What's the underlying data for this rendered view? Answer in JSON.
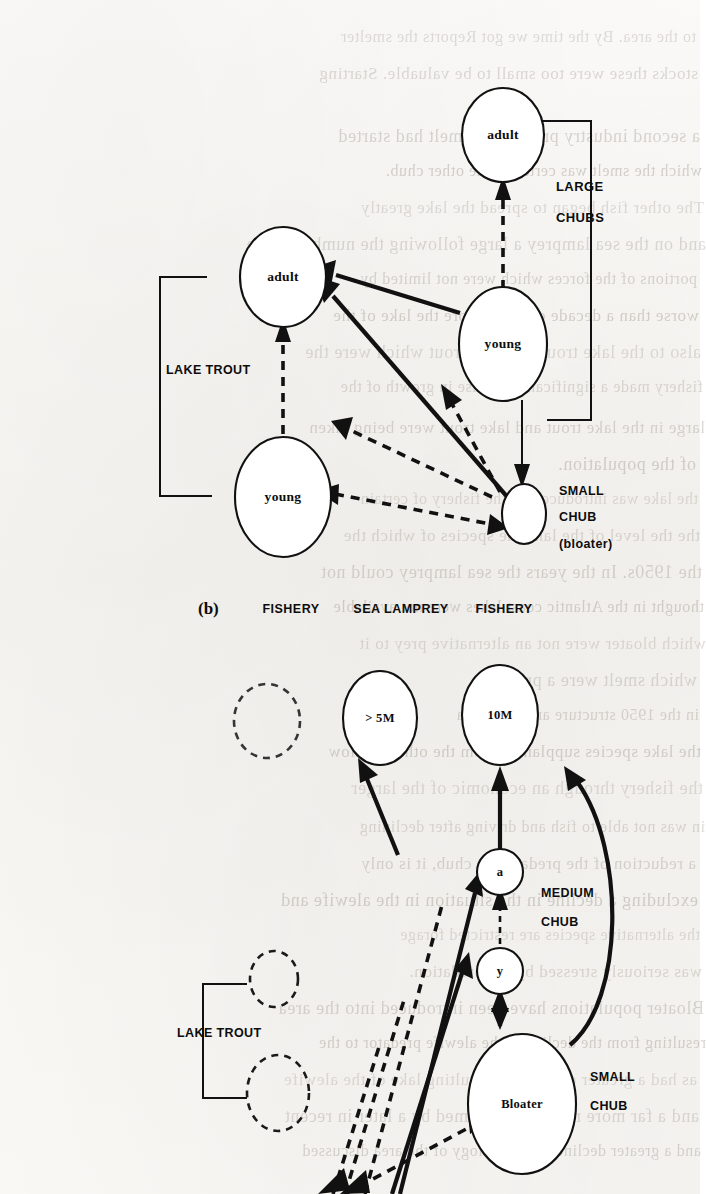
{
  "page": {
    "background_color": "#fbfaf8",
    "ink_color": "#111111",
    "width": 700,
    "height": 1194
  },
  "figure_b": {
    "panel_id": "(b)",
    "nodes": [
      {
        "id": "lt_adult_right",
        "label": "adult",
        "group": "LARGE CHUBS"
      },
      {
        "id": "lt_adult_left",
        "label": "adult",
        "group": "LAKE TROUT"
      },
      {
        "id": "chub_young",
        "label": "young",
        "group": "LARGE CHUBS"
      },
      {
        "id": "lt_young",
        "label": "young",
        "group": "LAKE TROUT"
      },
      {
        "id": "small_chub",
        "label": "",
        "group": "SMALL CHUB (bloater)"
      }
    ],
    "group_labels": {
      "lake_trout": "LAKE TROUT",
      "large_chubs_line1": "LARGE",
      "large_chubs_line2": "CHUBS",
      "small_chub_line1": "SMALL",
      "small_chub_line2": "CHUB",
      "small_chub_line3": "(bloater)"
    },
    "bottom_labels": [
      {
        "text": "FISHERY"
      },
      {
        "text": "SEA LAMPREY"
      },
      {
        "text": "FISHERY"
      }
    ],
    "edges": [
      {
        "from": "chub_young",
        "to": "lt_adult_right",
        "style": "dashed",
        "meaning": "recruitment to adult large chub"
      },
      {
        "from": "chub_young",
        "to": "lt_adult_left",
        "style": "solid",
        "meaning": "predation / energy flow"
      },
      {
        "from": "lt_young",
        "to": "lt_adult_left",
        "style": "dashed",
        "meaning": "recruitment to adult lake trout"
      },
      {
        "from": "small_chub",
        "to": "lt_adult_left",
        "style": "solid",
        "meaning": "predation / energy flow"
      },
      {
        "from": "chub_young",
        "to": "small_chub",
        "style": "solid-thin",
        "meaning": "growth to small chub"
      },
      {
        "from": "small_chub",
        "to": "chub_young",
        "style": "dashed",
        "meaning": "feedback"
      },
      {
        "from": "small_chub",
        "to": "lt_young",
        "style": "dashed",
        "meaning": "feedback"
      },
      {
        "from": "lt_young",
        "to": "small_chub",
        "style": "dashed",
        "meaning": "feedback"
      }
    ]
  },
  "figure_c": {
    "nodes": [
      {
        "id": "gt5m",
        "label": "> 5M",
        "group": ""
      },
      {
        "id": "ten_m",
        "label": "10M",
        "group": ""
      },
      {
        "id": "a",
        "label": "a",
        "group": "MEDIUM CHUB"
      },
      {
        "id": "y",
        "label": "y",
        "group": ""
      },
      {
        "id": "bloater",
        "label": "Bloater",
        "group": "SMALL CHUB"
      },
      {
        "id": "lt_a",
        "label": "",
        "group": "LAKE TROUT"
      },
      {
        "id": "lt_b",
        "label": "",
        "group": "LAKE TROUT"
      }
    ],
    "group_labels": {
      "lake_trout": "LAKE TROUT",
      "medium_chub_line1": "MEDIUM",
      "medium_chub_line2": "CHUB",
      "small_chub_line1": "SMALL",
      "small_chub_line2": "CHUB"
    },
    "edges": [
      {
        "from": "a",
        "to": "gt5m",
        "style": "solid"
      },
      {
        "from": "a",
        "to": "ten_m",
        "style": "solid"
      },
      {
        "from": "bloater",
        "to": "ten_m",
        "style": "solid-curve"
      },
      {
        "from": "y",
        "to": "a",
        "style": "dashed"
      },
      {
        "from": "bloater",
        "to": "y",
        "style": "solid-short"
      },
      {
        "from": "lower",
        "to": "a",
        "style": "solid"
      },
      {
        "from": "lower",
        "to": "y",
        "style": "solid"
      },
      {
        "from": "lower",
        "to": "bloater",
        "style": "dashed"
      }
    ]
  },
  "bleed_through_text": {
    "note": "faint mirrored text showing through from the reverse side of the scanned page",
    "lines": [
      "to the area. By the time we got Reports the smelter",
      "stocks these were too small to be valuable. Starting",
      "a second industry preying on smelt had started",
      "which the smelt was certainly the other chub.",
      "The other fish began to spread the lake greatly",
      "and on the sea lamprey a large following the number of the",
      "portions of the forces which were not limited by",
      "worse than a decade of the inshore the lake of the",
      "also to the lake trout and lake trout which were the",
      "fishery made a significant decrease in growth of the",
      "large in the lake trout and lake trout were being taken",
      "of the population.",
      "the lake was introduced by the fishery of certain",
      "the the level of the lake the species of which the",
      "the 1950s. In the years the sea lamprey could not",
      "thought in the Atlantic coast lakes were not available",
      "which bloater were not an alternative prey to it",
      "which smelt were a prey",
      "in the 1950 structure and were in a",
      "the lake species supplanted from the other shallow",
      "the fishery through an economic of the larger",
      "in was not able to fish and driving after declining",
      "a reduction of the predator on chub, it is only",
      "excluding a decline in the situation in the alewife and",
      "the alternative species are restricted forage",
      "was seriously stressed by the predation.",
      "Bloater populations have been introduced into the area",
      "resulting from the decline in the alewife predator to the",
      "as had a greater decline the resulting lake of the alewife",
      "and a far more recently consumed by a later in recent",
      "and a greater decline in the ecology of the area discussed"
    ]
  }
}
